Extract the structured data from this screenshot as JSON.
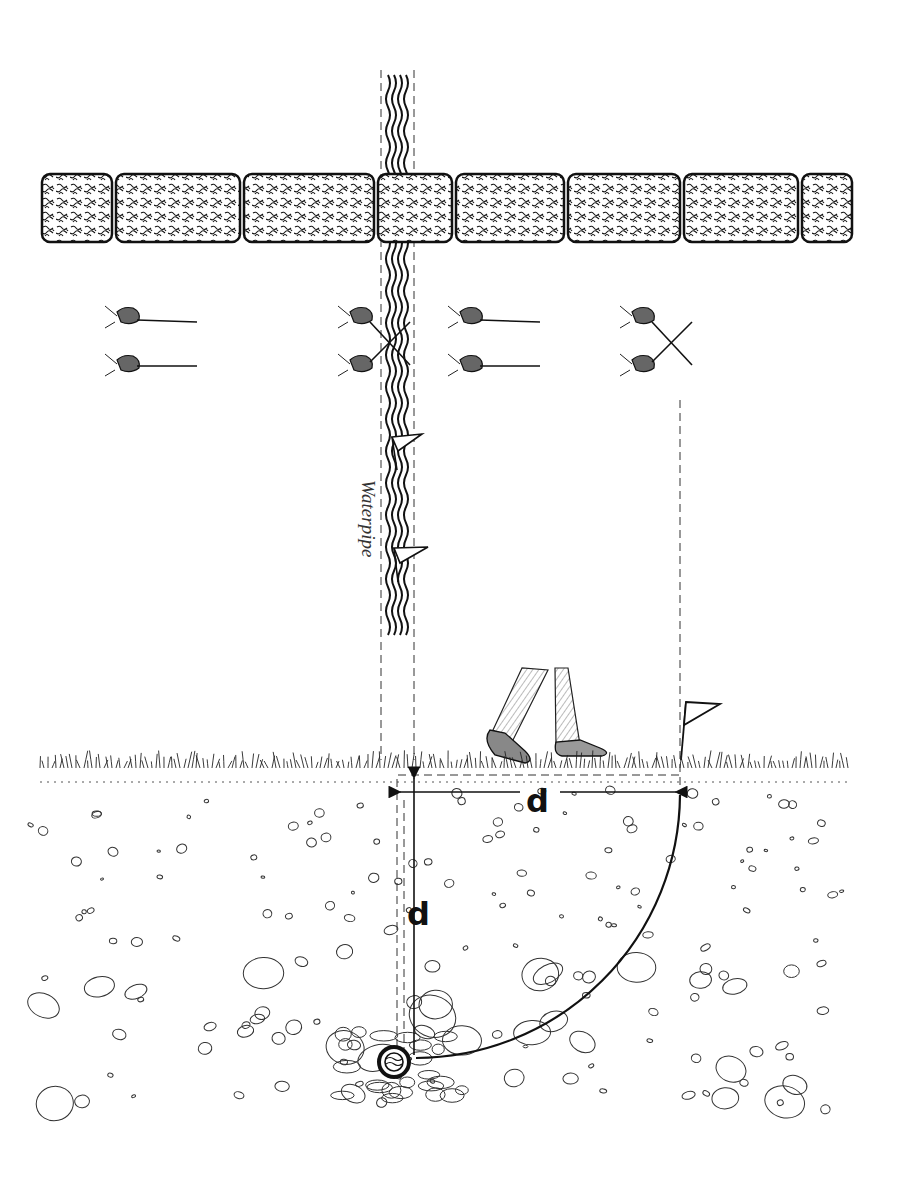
{
  "figure": {
    "type": "illustration",
    "colors": {
      "ink": "#1a1a1a",
      "paper": "#ffffff",
      "dash": "#333333"
    }
  },
  "labels": {
    "pipe_label": "Waterpipe",
    "horizontal_distance": "d",
    "vertical_depth": "d"
  },
  "wall": {
    "blocks": [
      {
        "x": 42,
        "w": 70
      },
      {
        "x": 116,
        "w": 124
      },
      {
        "x": 244,
        "w": 130
      },
      {
        "x": 378,
        "w": 74
      },
      {
        "x": 456,
        "w": 108
      },
      {
        "x": 568,
        "w": 112
      },
      {
        "x": 684,
        "w": 114
      },
      {
        "x": 802,
        "w": 50
      }
    ]
  },
  "rod_positions": [
    {
      "name": "rods-parallel-left",
      "x": 105,
      "state": "parallel"
    },
    {
      "name": "rods-crossed-pipe",
      "x": 338,
      "state": "crossed"
    },
    {
      "name": "rods-parallel-middle",
      "x": 448,
      "state": "parallel"
    },
    {
      "name": "rods-crossed-right",
      "x": 620,
      "state": "crossed"
    }
  ],
  "markers": {
    "pipe_flags": 2,
    "ground_flag": 1
  }
}
